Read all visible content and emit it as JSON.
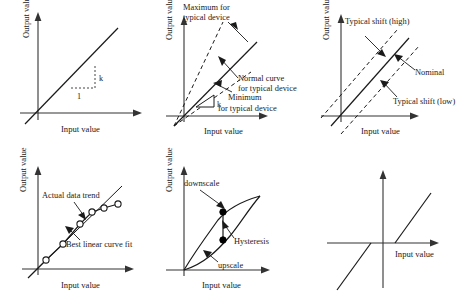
{
  "figure": {
    "background_color": "#ffffff",
    "line_color": "#1a1a1a",
    "axis_label_x": "Input value",
    "axis_label_y": "Output value"
  },
  "panels": [
    {
      "id": "ideal-linear",
      "position": "top-left",
      "axis_x": "Input value",
      "axis_y": "Output value",
      "annotations": [
        {
          "name": "slope-rise",
          "text": "k"
        },
        {
          "name": "slope-run",
          "text": "1"
        }
      ]
    },
    {
      "id": "sensitivity-tolerance",
      "position": "top-middle",
      "axis_x": "Input value",
      "axis_y": "Output value",
      "annotations": [
        {
          "name": "maximum-label",
          "line1": "Maximum for",
          "line2": "typical device"
        },
        {
          "name": "normal-curve-label",
          "line1": "Normal curve",
          "line2": "for typical device"
        },
        {
          "name": "minimum-label",
          "line1": "Minimum",
          "line2": "for typical device"
        },
        {
          "name": "slope-symbol",
          "text": "k"
        }
      ]
    },
    {
      "id": "offset-shift",
      "position": "top-right",
      "axis_x": "Input value",
      "axis_y": "Output value",
      "annotations": [
        {
          "name": "typical-shift-high-label",
          "text": "Typical shift (high)"
        },
        {
          "name": "nominal-label",
          "text": "Nominal"
        },
        {
          "name": "typical-shift-low-label",
          "text": "Typical shift (low)"
        }
      ]
    },
    {
      "id": "linearity-curve-fit",
      "position": "bottom-left",
      "axis_x": "Input value",
      "axis_y": "Output value",
      "annotations": [
        {
          "name": "actual-data-trend-label",
          "text": "Actual data trend"
        },
        {
          "name": "best-linear-curve-fit-label",
          "text": "Best linear curve fit"
        }
      ]
    },
    {
      "id": "hysteresis",
      "position": "bottom-middle",
      "axis_x": "Input value",
      "axis_y": "Output value",
      "annotations": [
        {
          "name": "downscale-label",
          "text": "downscale"
        },
        {
          "name": "hysteresis-label",
          "text": "Hysteresis"
        },
        {
          "name": "upscale-label",
          "text": "upscale"
        }
      ]
    },
    {
      "id": "dead-band",
      "position": "bottom-right",
      "axis_x": "Input value",
      "axis_y": "",
      "annotations": []
    }
  ]
}
